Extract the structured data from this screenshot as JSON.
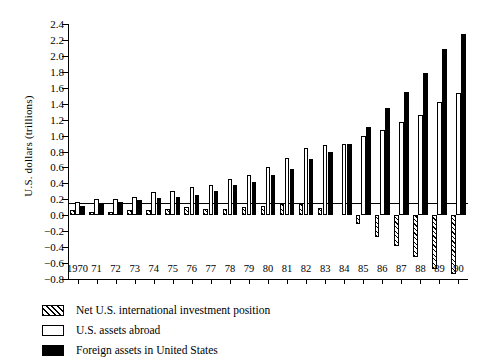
{
  "chart_data": {
    "type": "bar",
    "title": "",
    "subtitle": "",
    "xlabel": "",
    "ylabel": "U.S. dollars (trillions)",
    "ylim": [
      -0.8,
      2.4
    ],
    "ytick_step": 0.2,
    "grid": false,
    "legend_position": "below-axes-left",
    "categories": [
      "1970",
      "71",
      "72",
      "73",
      "74",
      "75",
      "76",
      "77",
      "78",
      "79",
      "80",
      "81",
      "82",
      "83",
      "84",
      "85",
      "86",
      "87",
      "88",
      "89",
      "90"
    ],
    "ytick_labels": [
      "2.4",
      "2.2",
      "2.0",
      "1.8",
      "1.6",
      "1.4",
      "1.2",
      "1.0",
      "0.8",
      "0.6",
      "0.4",
      "0.2",
      "0.0",
      "-0.2",
      "-0.4",
      "-0.6",
      "-0.8"
    ],
    "ytick_values": [
      2.4,
      2.2,
      2.0,
      1.8,
      1.6,
      1.4,
      1.2,
      1.0,
      0.8,
      0.6,
      0.4,
      0.2,
      0.0,
      -0.2,
      -0.4,
      -0.6,
      -0.8
    ],
    "series": [
      {
        "name": "Net U.S. international investment position",
        "key": "net",
        "fill": "hatched",
        "values": [
          0.06,
          0.04,
          0.04,
          0.06,
          0.07,
          0.08,
          0.1,
          0.08,
          0.08,
          0.1,
          0.11,
          0.14,
          0.14,
          0.09,
          0.0,
          -0.11,
          -0.27,
          -0.38,
          -0.53,
          -0.67,
          -0.74
        ]
      },
      {
        "name": "U.S. assets abroad",
        "key": "usa",
        "fill": "white",
        "values": [
          0.17,
          0.2,
          0.2,
          0.23,
          0.29,
          0.3,
          0.35,
          0.38,
          0.45,
          0.51,
          0.61,
          0.72,
          0.84,
          0.88,
          0.9,
          1.0,
          1.07,
          1.17,
          1.26,
          1.42,
          1.53
        ]
      },
      {
        "name": "Foreign assets in United States",
        "key": "fgn",
        "fill": "black",
        "values": [
          0.11,
          0.16,
          0.17,
          0.19,
          0.22,
          0.23,
          0.26,
          0.3,
          0.38,
          0.42,
          0.5,
          0.58,
          0.7,
          0.79,
          0.9,
          1.11,
          1.34,
          1.55,
          1.79,
          2.09,
          2.27
        ]
      }
    ]
  },
  "legend": {
    "items": [
      {
        "label": "Net U.S. international investment position",
        "swatch": "hatched-swatch"
      },
      {
        "label": "U.S. assets abroad",
        "swatch": "white-swatch"
      },
      {
        "label": "Foreign assets in United States",
        "swatch": "black-swatch"
      }
    ]
  },
  "axis": {
    "y_title": "U.S. dollars (trillions)"
  }
}
